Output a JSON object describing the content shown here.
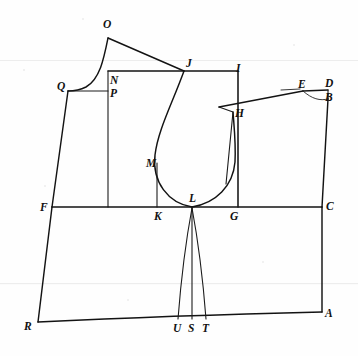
{
  "figure": {
    "kind": "tailoring-pattern-draft",
    "ink_color": "#131313",
    "paper_color": "#fefefe",
    "width": 358,
    "height": 356
  },
  "points": [
    {
      "id": "O",
      "label": "O",
      "x": 108,
      "y": 38,
      "label_x": 103,
      "label_y": 28
    },
    {
      "id": "Q",
      "label": "Q",
      "x": 68,
      "y": 91,
      "label_x": 57,
      "label_y": 90
    },
    {
      "id": "N",
      "label": "N",
      "x": 108,
      "y": 71,
      "label_x": 110,
      "label_y": 84
    },
    {
      "id": "P",
      "label": "P",
      "x": 108,
      "y": 91,
      "label_x": 110,
      "label_y": 97
    },
    {
      "id": "J",
      "label": "J",
      "x": 184,
      "y": 71,
      "label_x": 186,
      "label_y": 67
    },
    {
      "id": "I",
      "label": "I",
      "x": 238,
      "y": 71,
      "label_x": 236,
      "label_y": 72
    },
    {
      "id": "E",
      "label": "E",
      "x": 303,
      "y": 91,
      "label_x": 298,
      "label_y": 88
    },
    {
      "id": "D",
      "label": "D",
      "x": 328,
      "y": 90,
      "label_x": 325,
      "label_y": 87
    },
    {
      "id": "B",
      "label": "B",
      "x": 328,
      "y": 99,
      "label_x": 325,
      "label_y": 101
    },
    {
      "id": "H",
      "label": "H",
      "x": 233,
      "y": 112,
      "label_x": 235,
      "label_y": 117
    },
    {
      "id": "M",
      "label": "M",
      "x": 157,
      "y": 163,
      "label_x": 146,
      "label_y": 167
    },
    {
      "id": "L",
      "label": "L",
      "x": 192,
      "y": 207,
      "label_x": 189,
      "label_y": 202
    },
    {
      "id": "F",
      "label": "F",
      "x": 52,
      "y": 207,
      "label_x": 40,
      "label_y": 211
    },
    {
      "id": "K",
      "label": "K",
      "x": 157,
      "y": 207,
      "label_x": 154,
      "label_y": 220
    },
    {
      "id": "G",
      "label": "G",
      "x": 233,
      "y": 207,
      "label_x": 230,
      "label_y": 220
    },
    {
      "id": "C",
      "label": "C",
      "x": 322,
      "y": 207,
      "label_x": 326,
      "label_y": 210
    },
    {
      "id": "R",
      "label": "R",
      "x": 38,
      "y": 322,
      "label_x": 24,
      "label_y": 330
    },
    {
      "id": "A",
      "label": "A",
      "x": 322,
      "y": 312,
      "label_x": 325,
      "label_y": 317
    },
    {
      "id": "U",
      "label": "U",
      "x": 178,
      "y": 319,
      "label_x": 173,
      "label_y": 332
    },
    {
      "id": "S",
      "label": "S",
      "x": 192,
      "y": 319,
      "label_x": 188,
      "label_y": 332
    },
    {
      "id": "T",
      "label": "T",
      "x": 206,
      "y": 319,
      "label_x": 202,
      "label_y": 332
    }
  ],
  "strokes": [
    {
      "name": "front-shoulder-O-to-J",
      "d": "M108,38 L184,71"
    },
    {
      "name": "neck-curve-O-to-Q",
      "d": "M108,38 C104,58 100,79 86,87 C80,90 74,91 68,91"
    },
    {
      "name": "top-line-N-J-I",
      "d": "M108,71 L184,71 L238,71"
    },
    {
      "name": "short-line-Q-to-P",
      "d": "M68,91 L108,91"
    },
    {
      "name": "center-vertical-N-to-F-line",
      "d": "M108,71 L108,207"
    },
    {
      "name": "left-side-Q-to-F",
      "d": "M68,91 L52,207"
    },
    {
      "name": "left-side-F-to-R",
      "d": "M52,207 L38,322"
    },
    {
      "name": "waistline-F-to-C",
      "d": "M52,207 L322,207"
    },
    {
      "name": "hem-R-to-A",
      "d": "M38,322 C120,318 196,315 322,312"
    },
    {
      "name": "right-side-B-to-C",
      "d": "M328,99 L322,207"
    },
    {
      "name": "right-side-C-to-A",
      "d": "M322,207 L322,312"
    },
    {
      "name": "armhole-J-to-M-to-L",
      "d": "M184,71 C172,104 158,130 155,155 C152,182 168,203 192,207"
    },
    {
      "name": "armhole-L-to-H",
      "d": "M192,207 C216,203 233,186 235,162 C236,143 234,126 233,112"
    },
    {
      "name": "back-vertical-I-to-G",
      "d": "M238,71 L238,207"
    },
    {
      "name": "back-dart-sliver-H",
      "d": "M219,107 L233,112 L226,184"
    },
    {
      "name": "back-shoulder-H-to-E",
      "d": "M219,107 L303,91"
    },
    {
      "name": "back-shoulder-tick-E",
      "d": "M281,90 L300,89"
    },
    {
      "name": "back-neck-E-to-D",
      "d": "M303,91 L328,90"
    },
    {
      "name": "back-neck-curve-E-to-B",
      "d": "M303,91 C312,99 320,101 328,99"
    },
    {
      "name": "back-neck-drop-D-to-B",
      "d": "M328,90 L328,99"
    },
    {
      "name": "waist-dart-left-L-to-U",
      "d": "M192,208 C186,240 181,280 178,319"
    },
    {
      "name": "waist-dart-right-L-to-T",
      "d": "M192,208 C198,240 203,280 206,319"
    },
    {
      "name": "waist-dart-center-L-to-S",
      "d": "M192,208 L192,319"
    },
    {
      "name": "vertical-K-to-M",
      "d": "M157,207 L157,163"
    },
    {
      "name": "vertical-G-up",
      "d": "M238,207 L238,71"
    }
  ]
}
